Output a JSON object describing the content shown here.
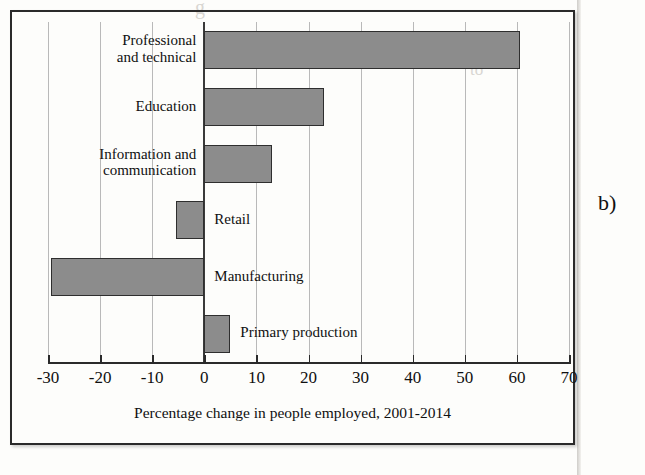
{
  "figure": {
    "panel_letter": "b)",
    "background_color": "#fdfdfb",
    "frame_color": "#2a2a2a",
    "bar_fill_color": "#8c8c8c",
    "bar_edge_color": "#2e2e2e",
    "gridline_color": "#b9b9b9"
  },
  "ghost_text": {
    "line1": "g",
    "line2": "to",
    "line3": "to reduce...",
    "line4": "",
    "line5": "",
    "line6": ""
  },
  "chart_data": {
    "type": "bar",
    "orientation": "horizontal",
    "title": "",
    "xlabel": "Percentage change in people employed, 2001-2014",
    "ylabel": "",
    "categories": [
      "Professional\nand technical",
      "Education",
      "Information and\ncommunication",
      "Retail",
      "Manufacturing",
      "Primary production"
    ],
    "values": [
      60.5,
      23,
      13,
      -5.5,
      -29.5,
      5
    ],
    "xlim": [
      -30,
      70
    ],
    "xticks": [
      -30,
      -20,
      -10,
      0,
      10,
      20,
      30,
      40,
      50,
      60,
      70
    ],
    "xticklabels": [
      "-30",
      "-20",
      "-10",
      "0",
      "10",
      "20",
      "30",
      "40",
      "50",
      "60",
      "70"
    ],
    "grid": true,
    "grid_axis": "x",
    "legend": false,
    "label_placement": [
      "outside-left",
      "outside-left",
      "outside-left",
      "inside-right",
      "inside-right",
      "inside-right"
    ]
  }
}
